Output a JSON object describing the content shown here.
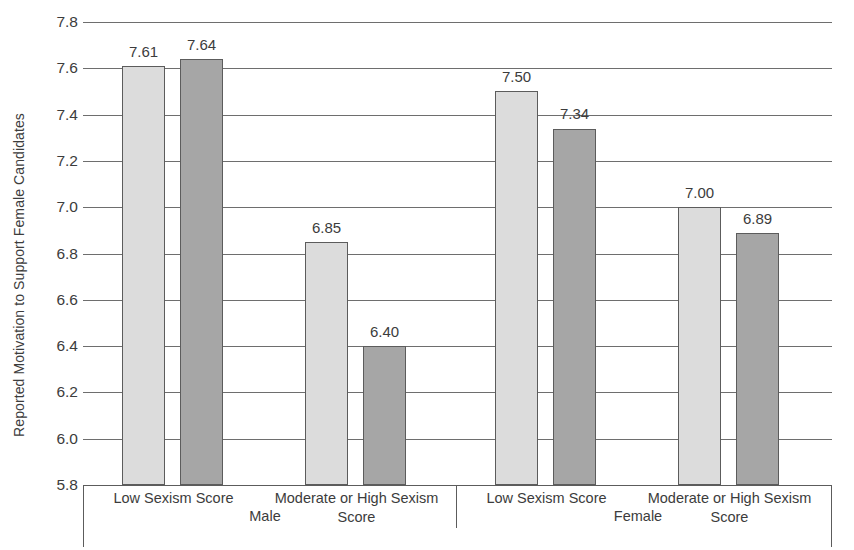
{
  "chart_data": {
    "type": "bar",
    "title": "",
    "xlabel": "",
    "ylabel": "Reported Motivation to Support Female Candidates",
    "ylim": [
      5.8,
      7.8
    ],
    "ytick_step": 0.2,
    "ytick_labels": [
      "7.8",
      "7.6",
      "7.4",
      "7.2",
      "7.0",
      "6.8",
      "6.6",
      "6.4",
      "6.2",
      "6.0",
      "5.8"
    ],
    "ytick_values": [
      7.8,
      7.6,
      7.4,
      7.2,
      7.0,
      6.8,
      6.6,
      6.4,
      6.2,
      6.0,
      5.8
    ],
    "grid": true,
    "legend": "none",
    "groups": [
      {
        "name": "Male",
        "categories": [
          "Low Sexism Score",
          "Moderate or High Sexism Score"
        ]
      },
      {
        "name": "Female",
        "categories": [
          "Low Sexism Score",
          "Moderate or High Sexism Score"
        ]
      }
    ],
    "series": [
      {
        "name": "light-series",
        "color": "#dcdcdc",
        "values": [
          7.61,
          6.85,
          7.5,
          7.0
        ]
      },
      {
        "name": "dark-series",
        "color": "#a6a6a6",
        "values": [
          7.64,
          6.4,
          7.34,
          6.89
        ]
      }
    ],
    "bars": [
      {
        "group": "Male",
        "category": "Low Sexism Score",
        "series": "light-series",
        "value": 7.61,
        "label": "7.61"
      },
      {
        "group": "Male",
        "category": "Low Sexism Score",
        "series": "dark-series",
        "value": 7.64,
        "label": "7.64"
      },
      {
        "group": "Male",
        "category": "Moderate or High Sexism Score",
        "series": "light-series",
        "value": 6.85,
        "label": "6.85"
      },
      {
        "group": "Male",
        "category": "Moderate or High Sexism Score",
        "series": "dark-series",
        "value": 6.4,
        "label": "6.40"
      },
      {
        "group": "Female",
        "category": "Low Sexism Score",
        "series": "light-series",
        "value": 7.5,
        "label": "7.50"
      },
      {
        "group": "Female",
        "category": "Low Sexism Score",
        "series": "dark-series",
        "value": 7.34,
        "label": "7.34"
      },
      {
        "group": "Female",
        "category": "Moderate or High Sexism Score",
        "series": "light-series",
        "value": 7.0,
        "label": "7.00"
      },
      {
        "group": "Female",
        "category": "Moderate or High Sexism Score",
        "series": "dark-series",
        "value": 6.89,
        "label": "6.89"
      }
    ],
    "colors": {
      "light_bar": "#dcdcdc",
      "dark_bar": "#a6a6a6",
      "bar_border": "#5c5c5c",
      "gridline": "#6e6e6e",
      "text": "#3c3c3c",
      "background": "#ffffff"
    }
  }
}
